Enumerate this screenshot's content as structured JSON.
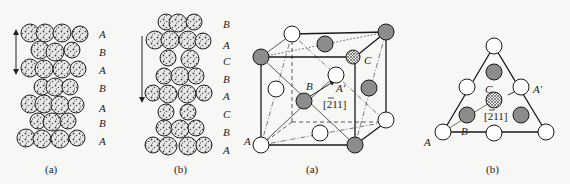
{
  "figures": [
    {
      "id": "stacking-hcp",
      "caption": "(a)",
      "layer_labels": [
        "A",
        "B",
        "A",
        "B",
        "A",
        "B",
        "A"
      ],
      "arrow": "double-headed vertical"
    },
    {
      "id": "stacking-fcc",
      "caption": "(b)",
      "layer_labels": [
        "B",
        "A",
        "C",
        "B",
        "A",
        "C",
        "B",
        "A"
      ],
      "arrow": "single-headed downward"
    },
    {
      "id": "fcc-unit-cell",
      "caption": "(a)",
      "point_labels": {
        "A": "A",
        "B": "B",
        "C": "C",
        "A_prime": "A′"
      },
      "direction": {
        "prefix": "[",
        "bar": "2",
        "rest": "11]"
      }
    },
    {
      "id": "111-plane-triangle",
      "caption": "(b)",
      "point_labels": {
        "A": "A",
        "B": "B",
        "C": "C",
        "A_prime": "A′"
      },
      "direction": {
        "prefix": "[",
        "bar": "2",
        "rest": "11]"
      }
    }
  ],
  "colors": {
    "atom_white": "#ffffff",
    "atom_gray": "#8c8c8c",
    "atom_hatched": "#dcdcdc",
    "stroke": "#1a1a1a"
  }
}
